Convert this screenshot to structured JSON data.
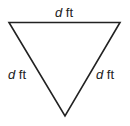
{
  "diagram": {
    "shape": "equilateral-triangle",
    "orientation": "pointing-down",
    "stroke_color": "#222222",
    "sides": [
      {
        "position": "top",
        "variable": "d",
        "unit": "ft"
      },
      {
        "position": "left",
        "variable": "d",
        "unit": "ft"
      },
      {
        "position": "right",
        "variable": "d",
        "unit": "ft"
      }
    ]
  }
}
